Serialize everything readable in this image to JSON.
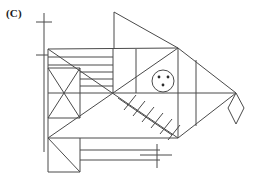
{
  "figure": {
    "label": "(C)",
    "caption_letter": "C",
    "stroke_color": "#4a4a4a",
    "dot_color": "#2b2b2b",
    "background_color": "#ffffff",
    "width": 255,
    "height": 180,
    "parts": [
      {
        "name": "dorsal-fin",
        "shape": "triangle"
      },
      {
        "name": "fish-body",
        "shape": "polygon"
      },
      {
        "name": "tail-fin",
        "shape": "triangle"
      },
      {
        "name": "tail-tip-diamond",
        "shape": "diamond"
      },
      {
        "name": "head-box-with-x",
        "shape": "square-with-diagonals"
      },
      {
        "name": "gill-stripes",
        "shape": "horizontal-lines"
      },
      {
        "name": "pectoral-fin-hatching",
        "shape": "hatched-diagonal"
      },
      {
        "name": "eye",
        "shape": "circle-with-three-dots"
      },
      {
        "name": "lower-jaw-box",
        "shape": "square-with-diagonal"
      },
      {
        "name": "belly-strip",
        "shape": "rectangle"
      },
      {
        "name": "top-left-axis-tick",
        "shape": "cross"
      },
      {
        "name": "bottom-center-tick",
        "shape": "cross"
      }
    ],
    "eye": {
      "center_x": 163,
      "center_y": 81,
      "radius": 11,
      "dot_count": 3,
      "dots": [
        {
          "x": 159,
          "y": 77
        },
        {
          "x": 168,
          "y": 77
        },
        {
          "x": 163,
          "y": 85
        }
      ]
    },
    "gill_stripes": {
      "count": 5,
      "x_start": 48,
      "x_end": 113,
      "y_values": [
        57,
        65,
        72,
        79,
        86
      ]
    },
    "fin_hatching": {
      "count": 6,
      "axis_start": {
        "x": 118,
        "y": 98
      },
      "axis_end": {
        "x": 172,
        "y": 135
      }
    }
  }
}
